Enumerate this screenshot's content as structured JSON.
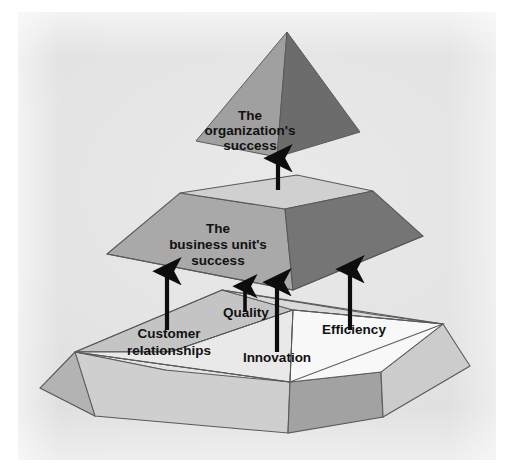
{
  "diagram": {
    "type": "3d-layered-pyramid",
    "title_visible": false,
    "background_color": "#e4e4e4",
    "outline_color": "#5a5a5a",
    "text_color": "#111111",
    "levels": [
      {
        "id": "apex",
        "order": 3,
        "shape": "pyramid",
        "label_lines": [
          "The",
          "organization's",
          "success"
        ],
        "faces": {
          "left_color": "#9d9d9d",
          "right_color": "#6e6e6e"
        }
      },
      {
        "id": "middle",
        "order": 2,
        "shape": "frustum",
        "label_lines": [
          "The",
          "business unit's",
          "success"
        ],
        "faces": {
          "top_color": "#cfcfcf",
          "left_color": "#a6a6a6",
          "right_color": "#787878",
          "front_right_color": "#6f6f6f"
        }
      },
      {
        "id": "base",
        "order": 1,
        "shape": "segmented-frustum",
        "label_lines": [],
        "faces": {
          "top_back_left_color": "#c3c3c3",
          "top_back_right_color": "#d9d9d9",
          "top_front_left_color": "#e8e8e8",
          "top_front_right_color": "#f7f7f7",
          "left_side_color": "#b5b5b5",
          "front_left_color": "#d0d0d0",
          "front_right_color": "#a0a0a0",
          "right_side_color": "#cfcfcf"
        },
        "segments": [
          {
            "id": "customer-relationships",
            "label_lines": [
              "Customer",
              "relationships"
            ]
          },
          {
            "id": "quality",
            "label_lines": [
              "Quality"
            ]
          },
          {
            "id": "innovation",
            "label_lines": [
              "Innovation"
            ]
          },
          {
            "id": "efficiency",
            "label_lines": [
              "Efficiency"
            ]
          }
        ]
      }
    ],
    "arrows": [
      {
        "id": "apex-arrow",
        "from": "middle",
        "to": "apex",
        "label": ""
      },
      {
        "id": "customer-relationships-arrow",
        "from": "base",
        "to": "middle",
        "label": "Customer relationships"
      },
      {
        "id": "quality-arrow",
        "from": "base",
        "to": "middle",
        "label": "Quality"
      },
      {
        "id": "innovation-arrow",
        "from": "base",
        "to": "middle",
        "label": "Innovation"
      },
      {
        "id": "efficiency-arrow",
        "from": "base",
        "to": "middle",
        "label": "Efficiency"
      }
    ],
    "labels": {
      "apex_line1": "The",
      "apex_line2": "organization's",
      "apex_line3": "success",
      "middle_line1": "The",
      "middle_line2": "business unit's",
      "middle_line3": "success",
      "customer_line1": "Customer",
      "customer_line2": "relationships",
      "quality": "Quality",
      "innovation": "Innovation",
      "efficiency": "Efficiency"
    }
  }
}
